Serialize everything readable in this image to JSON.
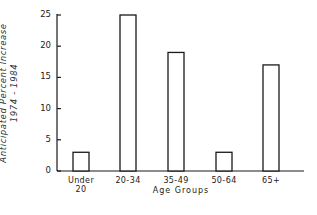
{
  "chart_data": {
    "type": "bar",
    "title": "",
    "xlabel": "Age Groups",
    "ylabel": "Anticipated Percent Increase 1974 - 1984",
    "ylabel_lines": [
      "Anticipated Percent Increase",
      "1974 - 1984"
    ],
    "categories": [
      "Under 20",
      "20-34",
      "35-49",
      "50-64",
      "65+"
    ],
    "category_lines": [
      [
        "Under",
        "20"
      ],
      [
        "20-34"
      ],
      [
        "35-49"
      ],
      [
        "50-64"
      ],
      [
        "65+"
      ]
    ],
    "values": [
      3,
      25,
      19,
      3,
      17
    ],
    "ylim": [
      0,
      25
    ],
    "yticks": [
      0,
      5,
      10,
      15,
      20,
      25
    ],
    "grid": false,
    "legend": null,
    "bar_fill": "#ffffff",
    "bar_stroke": "#1a1a1a"
  }
}
